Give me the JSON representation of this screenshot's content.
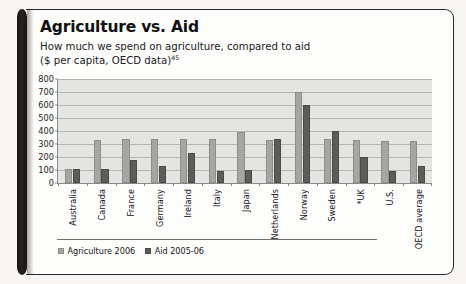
{
  "figure": {
    "title": "Agriculture vs. Aid",
    "subtitle_line1": "How much we spend on agriculture, compared to aid",
    "subtitle_line2": "($ per capita, OECD data)",
    "footnote_marker": "45"
  },
  "legend": {
    "position": "bottom-left",
    "items": [
      {
        "label": "Agriculture 2006",
        "color": "#a5a5a3",
        "swatch": "legend-swatch-agriculture"
      },
      {
        "label": "Aid 2005-06",
        "color": "#5c5c5a",
        "swatch": "legend-swatch-aid"
      }
    ]
  },
  "axes": {
    "y_ticks": [
      "800",
      "700",
      "600",
      "500",
      "400",
      "300",
      "200",
      "100",
      "0"
    ],
    "y_min": 0,
    "y_max": 800,
    "y_step": 100
  },
  "chart_data": {
    "type": "bar",
    "title": "Agriculture vs. Aid",
    "subtitle": "How much we spend on agriculture, compared to aid ($ per capita, OECD data)",
    "xlabel": "",
    "ylabel": "",
    "ylim": [
      0,
      800
    ],
    "ytick_step": 100,
    "grid": true,
    "legend_position": "bottom-left",
    "categories": [
      "Australia",
      "Canada",
      "France",
      "Germany",
      "Ireland",
      "Italy",
      "Japan",
      "Netherlands",
      "Norway",
      "Sweden",
      "*UK",
      "U.S.",
      "OECD average"
    ],
    "series": [
      {
        "name": "Agriculture 2006",
        "color": "#a5a5a3",
        "values": [
          105,
          330,
          340,
          340,
          340,
          340,
          390,
          330,
          700,
          335,
          330,
          320,
          320
        ]
      },
      {
        "name": "Aid 2005-06",
        "color": "#5c5c5a",
        "values": [
          110,
          110,
          180,
          130,
          230,
          90,
          100,
          340,
          600,
          400,
          200,
          90,
          130
        ]
      }
    ]
  }
}
